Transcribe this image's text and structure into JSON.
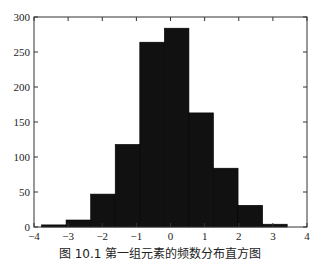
{
  "chart_data": {
    "type": "bar",
    "subtype": "histogram",
    "title": "",
    "xlabel": "",
    "ylabel": "",
    "xlim": [
      -4,
      4
    ],
    "ylim": [
      0,
      300
    ],
    "xticks": [
      -4,
      -3,
      -2,
      -1,
      0,
      1,
      2,
      3,
      4
    ],
    "yticks": [
      0,
      50,
      100,
      150,
      200,
      250,
      300
    ],
    "bin_edges": [
      -3.78,
      -3.06,
      -2.34,
      -1.62,
      -0.9,
      -0.18,
      0.54,
      1.26,
      1.98,
      2.7,
      3.42
    ],
    "categories": [
      "-3.42",
      "-2.70",
      "-1.98",
      "-1.26",
      "-0.54",
      "0.18",
      "0.90",
      "1.62",
      "2.34",
      "3.06"
    ],
    "values": [
      3,
      10,
      47,
      118,
      264,
      284,
      163,
      84,
      31,
      4
    ],
    "bar_color": "#111111",
    "grid": false,
    "legend": null
  },
  "caption": "图 10.1 第一组元素的频数分布直方图"
}
